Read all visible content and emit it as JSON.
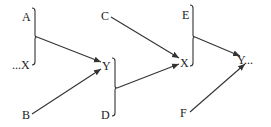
{
  "diagram": {
    "nodes": {
      "A": "A",
      "X1": "...X",
      "B": "B",
      "Y1": "Y",
      "D": "D",
      "C": "C",
      "X2": "X",
      "E": "E",
      "Y2": "Y...",
      "F": "F"
    },
    "edges": [
      {
        "from": "{A, ...X}",
        "to": "Y"
      },
      {
        "from": "B",
        "to": "Y"
      },
      {
        "from": "C",
        "to": "X"
      },
      {
        "from": "{Y, D}",
        "to": "X"
      },
      {
        "from": "{E, X}",
        "to": "Y..."
      },
      {
        "from": "F",
        "to": "Y..."
      }
    ],
    "colors": {
      "ink": "#333333",
      "background": "#ffffff"
    }
  }
}
